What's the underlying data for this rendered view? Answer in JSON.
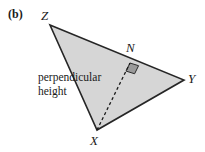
{
  "figure": {
    "part_label": "(b)",
    "background_color": "#ffffff",
    "triangle": {
      "fill_color": "#d6d6d6",
      "stroke_color": "#262626",
      "stroke_width": 1.6,
      "vertices": [
        {
          "name": "Z",
          "label": "Z",
          "x": 50,
          "y": 25
        },
        {
          "name": "Y",
          "label": "Y",
          "x": 184,
          "y": 80
        },
        {
          "name": "X",
          "label": "X",
          "x": 97,
          "y": 130
        }
      ]
    },
    "foot_of_perpendicular": {
      "name": "N",
      "label": "N",
      "x": 130,
      "y": 63,
      "lies_on_side": "ZY"
    },
    "perpendicular_height_line": {
      "from": "X",
      "to": "N",
      "style": "dashed",
      "stroke_color": "#1a1a1a",
      "dash_pattern": "3,2.6"
    },
    "right_angle_marker": {
      "at": "N",
      "fill_color": "#9a9a9a",
      "stroke_color": "#2b2b2b",
      "size": 9
    },
    "annotation": {
      "line1": "perpendicular",
      "line2": "height"
    }
  }
}
